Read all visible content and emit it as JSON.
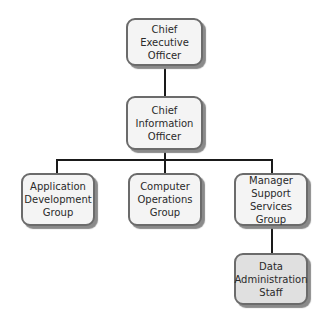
{
  "diagram": {
    "type": "org-chart",
    "colors": {
      "node_fill": "#f4f4f4",
      "node_fill_shaded": "#e0e0e0",
      "node_border": "#6b6b6b",
      "node_shadow": "#8a8a8a",
      "connector": "#1a1a1a",
      "text": "#2a2a2a"
    },
    "nodes": [
      {
        "id": "ceo",
        "label": "Chief Executive\nOfficer",
        "level": 0,
        "shaded": false
      },
      {
        "id": "cio",
        "label": "Chief\nInformation\nOfficer",
        "level": 1,
        "parent": "ceo",
        "shaded": false
      },
      {
        "id": "app_dev",
        "label": "Application\nDevelopment\nGroup",
        "level": 2,
        "parent": "cio",
        "shaded": false
      },
      {
        "id": "comp_ops",
        "label": "Computer\nOperations\nGroup",
        "level": 2,
        "parent": "cio",
        "shaded": false
      },
      {
        "id": "mgr_support",
        "label": "Manager\nSupport\nServices Group",
        "level": 2,
        "parent": "cio",
        "shaded": false
      },
      {
        "id": "data_admin",
        "label": "Data\nAdministration\nStaff",
        "level": 3,
        "parent": "mgr_support",
        "shaded": true
      }
    ],
    "edges": [
      {
        "from": "ceo",
        "to": "cio"
      },
      {
        "from": "cio",
        "to": "app_dev"
      },
      {
        "from": "cio",
        "to": "comp_ops"
      },
      {
        "from": "cio",
        "to": "mgr_support"
      },
      {
        "from": "mgr_support",
        "to": "data_admin"
      }
    ]
  }
}
